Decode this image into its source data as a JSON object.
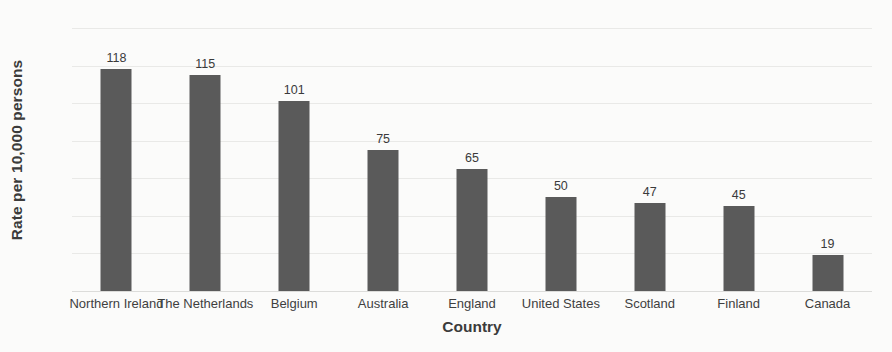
{
  "chart_data": {
    "type": "bar",
    "title": "",
    "xlabel": "Country",
    "ylabel": "Rate per 10,000 persons",
    "categories": [
      "Northern Ireland",
      "The Netherlands",
      "Belgium",
      "Australia",
      "England",
      "United States",
      "Scotland",
      "Finland",
      "Canada"
    ],
    "values": [
      118,
      115,
      101,
      75,
      65,
      50,
      47,
      45,
      19
    ],
    "ylim": [
      0,
      140
    ],
    "ytick_values": [
      0,
      20,
      40,
      60,
      80,
      100,
      120,
      140
    ],
    "ytick_labels": [
      "0",
      "20",
      "40",
      "60",
      "80",
      "100",
      "120",
      "140"
    ],
    "data_labels": [
      "118",
      "115",
      "101",
      "75",
      "65",
      "50",
      "47",
      "45",
      "19"
    ],
    "grid": true,
    "legend": "none",
    "bar_color": "#5a5a5a",
    "gridline_color": "#e9e9e7",
    "background_color": "#fbfbfa",
    "text_color": "#3f3f3f"
  }
}
